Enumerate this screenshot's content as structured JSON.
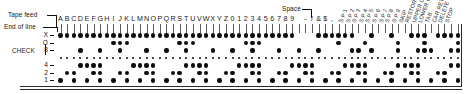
{
  "annotations": {
    "tape_feed": "Tape feed",
    "end_of_line": "End of line",
    "space": "Space",
    "check": "CHECK"
  },
  "rows": [
    {
      "id": "X",
      "label": "X"
    },
    {
      "id": "O",
      "label": "O"
    },
    {
      "id": "8",
      "label": "8"
    },
    {
      "id": "dots",
      "label": ""
    },
    {
      "id": "4",
      "label": "4"
    },
    {
      "id": "2",
      "label": "2"
    },
    {
      "id": "1",
      "label": "1"
    }
  ],
  "columns": [
    {
      "label": "A",
      "rot": false
    },
    {
      "label": "B",
      "rot": false
    },
    {
      "label": "C",
      "rot": false
    },
    {
      "label": "D",
      "rot": false
    },
    {
      "label": "E",
      "rot": false
    },
    {
      "label": "F",
      "rot": false
    },
    {
      "label": "G",
      "rot": false
    },
    {
      "label": "H",
      "rot": false
    },
    {
      "label": "I",
      "rot": false
    },
    {
      "label": "J",
      "rot": false
    },
    {
      "label": "K",
      "rot": false
    },
    {
      "label": "L",
      "rot": false
    },
    {
      "label": "M",
      "rot": false
    },
    {
      "label": "N",
      "rot": false
    },
    {
      "label": "O",
      "rot": false
    },
    {
      "label": "P",
      "rot": false
    },
    {
      "label": "Q",
      "rot": false
    },
    {
      "label": "R",
      "rot": false
    },
    {
      "label": "S",
      "rot": false
    },
    {
      "label": "T",
      "rot": false
    },
    {
      "label": "U",
      "rot": false
    },
    {
      "label": "V",
      "rot": false
    },
    {
      "label": "W",
      "rot": false
    },
    {
      "label": "X",
      "rot": false
    },
    {
      "label": "Y",
      "rot": false
    },
    {
      "label": "Z",
      "rot": false
    },
    {
      "label": "0",
      "rot": false
    },
    {
      "label": "1",
      "rot": false
    },
    {
      "label": "2",
      "rot": false
    },
    {
      "label": "3",
      "rot": false
    },
    {
      "label": "4",
      "rot": false
    },
    {
      "label": "5",
      "rot": false
    },
    {
      "label": "6",
      "rot": false
    },
    {
      "label": "7",
      "rot": false
    },
    {
      "label": "8",
      "rot": false
    },
    {
      "label": "9",
      "rot": false
    },
    {
      "label": "",
      "rot": false
    },
    {
      "label": "-",
      "rot": false
    },
    {
      "label": "/",
      "rot": false
    },
    {
      "label": "&",
      "rot": false
    },
    {
      "label": "$",
      "rot": false
    },
    {
      "label": ",",
      "rot": false
    },
    {
      "label": ".",
      "rot": false
    },
    {
      "label": "S P 1",
      "rot": true
    },
    {
      "label": "S P 2",
      "rot": true
    },
    {
      "label": "S P 3",
      "rot": true
    },
    {
      "label": "S P 4",
      "rot": true
    },
    {
      "label": "S P 5",
      "rot": true
    },
    {
      "label": "S P 6",
      "rot": true
    },
    {
      "label": "S P 7",
      "rot": true
    },
    {
      "label": "S P 8",
      "rot": true
    },
    {
      "label": "S P 9",
      "rot": true
    },
    {
      "label": "SKIP",
      "rot": true
    },
    {
      "label": "RESTORE",
      "rot": true
    },
    {
      "label": "UPPER CASE",
      "rot": true
    },
    {
      "label": "LOWER CASE",
      "rot": true
    },
    {
      "label": "TAB",
      "rot": true
    },
    {
      "label": "CAR RET",
      "rot": true
    },
    {
      "label": "DELETE",
      "rot": true
    },
    {
      "label": "STOP",
      "rot": true
    }
  ],
  "punch_matrix": [
    "1111111111111111111111111111111111110001111110010010011101111",
    "0000000011100000001110000000111000000000001000100001000100001",
    "0001001001000100100100010010010001001001000011010001001110011",
    "0000000000000000000000000000000000000000000000000000000000000",
    "0001111000011110000111100001111000011110000111100001111000011",
    "0110011001100110011001100110011001100110011001100110011001100",
    "1010101010101010101010101010101010101010101010101010101010101"
  ],
  "colors": {
    "ink": "#0d0d0d",
    "rule": "#2b2b2b",
    "tick": "#5a5a5a",
    "paper": "#ffffff"
  },
  "geometry": {
    "col_start_x": 60.5,
    "col_step": 6.62,
    "col_count": 61,
    "row_y": [
      35.5,
      43.0,
      50.5,
      58.0,
      65.5,
      73.0,
      80.5
    ],
    "dot_row_small_index": 3
  }
}
